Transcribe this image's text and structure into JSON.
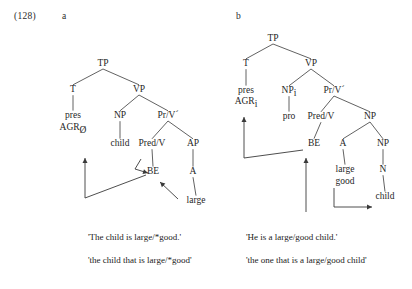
{
  "example": {
    "number": "(128)",
    "sub_a": "a",
    "sub_b": "b"
  },
  "tree_a": {
    "id": "a",
    "nodes": {
      "tp": {
        "label": "TP",
        "x": 103,
        "y": 66
      },
      "t": {
        "label": "T",
        "x": 73,
        "y": 92
      },
      "vp": {
        "label": "VP",
        "x": 139,
        "y": 92
      },
      "pres": {
        "label": "pres",
        "x": 73,
        "y": 118
      },
      "agr": {
        "label": "AGR",
        "sub": "Ø",
        "x": 73,
        "y": 130
      },
      "np": {
        "label": "NP",
        "x": 120,
        "y": 118
      },
      "prv": {
        "label": "Pr/V´",
        "x": 168,
        "y": 118
      },
      "child": {
        "label": "child",
        "x": 120,
        "y": 146
      },
      "predv": {
        "label": "Pred/V",
        "x": 152,
        "y": 146
      },
      "ap": {
        "label": "AP",
        "x": 193,
        "y": 146
      },
      "be": {
        "label": "BE",
        "x": 153,
        "y": 174
      },
      "a": {
        "label": "A",
        "x": 193,
        "y": 174
      },
      "large": {
        "label": "large",
        "x": 196,
        "y": 203
      }
    }
  },
  "tree_b": {
    "id": "b",
    "nodes": {
      "tp": {
        "label": "TP",
        "x": 273,
        "y": 41
      },
      "t": {
        "label": "T",
        "x": 246,
        "y": 66
      },
      "vp": {
        "label": "VP",
        "x": 311,
        "y": 66
      },
      "pres": {
        "label": "pres",
        "x": 246,
        "y": 93
      },
      "agr": {
        "label": "AGR",
        "sub": "i",
        "x": 246,
        "y": 104
      },
      "np_i": {
        "label": "NP",
        "sub": "i",
        "x": 289,
        "y": 93
      },
      "prv": {
        "label": "Pr/V´",
        "x": 334,
        "y": 93
      },
      "pro": {
        "label": "pro",
        "x": 289,
        "y": 119
      },
      "predv": {
        "label": "Pred/V",
        "x": 321,
        "y": 119
      },
      "np": {
        "label": "NP",
        "x": 370,
        "y": 119
      },
      "be": {
        "label": "BE",
        "x": 314,
        "y": 146
      },
      "a": {
        "label": "A",
        "x": 343,
        "y": 146
      },
      "np2": {
        "label": "NP",
        "x": 383,
        "y": 146
      },
      "large": {
        "label": "large",
        "x": 345,
        "y": 172
      },
      "good": {
        "label": "good",
        "x": 345,
        "y": 184
      },
      "n": {
        "label": "N",
        "x": 383,
        "y": 172
      },
      "child": {
        "label": "child",
        "x": 385,
        "y": 199
      }
    }
  },
  "glosses": {
    "a_line1": "'The child is large/*good.'",
    "a_line2": "'the child that is large/*good'",
    "b_line1": "'He is a large/good child.'",
    "b_line2": "'the one that is a large/good child'"
  },
  "colors": {
    "text": "#1f1f1f",
    "line": "#3a3a3a",
    "background": "#ffffff"
  }
}
